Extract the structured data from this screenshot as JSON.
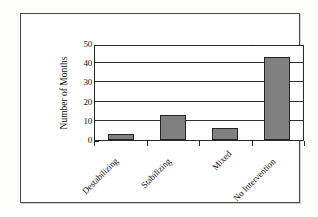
{
  "chart_data": {
    "type": "bar",
    "title": "",
    "xlabel": "",
    "ylabel": "Number of Months",
    "categories": [
      "Destabilizing",
      "Stabilizing",
      "Mixed",
      "No Intervention"
    ],
    "values": [
      3,
      13,
      6,
      43
    ],
    "ylim": [
      0,
      50
    ],
    "yticks": [
      0,
      10,
      20,
      30,
      40,
      50
    ],
    "ytick_labels": [
      "0",
      "10",
      "20",
      "30",
      "40",
      "50"
    ],
    "grid": true,
    "grid_axis": "y",
    "legend": false,
    "bar_color": "#808080",
    "bar_edge_color": "#242424",
    "axis_color": "#2a2a2a",
    "background_color": "#ffffff",
    "frame_color": "#4a4a4a"
  }
}
